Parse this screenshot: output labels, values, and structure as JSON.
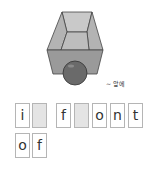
{
  "illustration": {
    "icon": "box-with-ball-icon",
    "description": "open gray box with a dark sphere in front of it",
    "colors": {
      "box_light": "#c4c4c4",
      "box_mid": "#a9a9a9",
      "box_dark": "#8f8f8f",
      "ball": "#6e6e6e",
      "outline": "#444444"
    }
  },
  "caption": "~ 앞에",
  "word_tiles": {
    "rows": [
      [
        {
          "letter": "i",
          "blank": false
        },
        {
          "letter": "",
          "blank": true
        },
        {
          "letter": "f",
          "blank": false
        },
        {
          "letter": "",
          "blank": true
        },
        {
          "letter": "o",
          "blank": false
        },
        {
          "letter": "n",
          "blank": false
        },
        {
          "letter": "t",
          "blank": false
        }
      ],
      [
        {
          "letter": "o",
          "blank": false
        },
        {
          "letter": "f",
          "blank": false
        }
      ]
    ],
    "colors": {
      "border": "#b5b5b5",
      "blank_fill": "#e4e4e4",
      "text": "#333333"
    }
  }
}
